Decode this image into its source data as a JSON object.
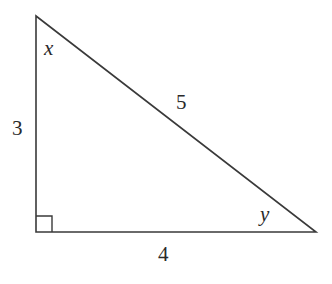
{
  "diagram": {
    "type": "right-triangle",
    "stroke_color": "#3a3a3a",
    "vertices": {
      "top": [
        36,
        16
      ],
      "right_angle": [
        36,
        232
      ],
      "right": [
        316,
        232
      ]
    },
    "right_angle_marker_size": 16,
    "sides": {
      "vertical": {
        "label": "3"
      },
      "hypotenuse": {
        "label": "5"
      },
      "horizontal": {
        "label": "4"
      }
    },
    "angles": {
      "top": {
        "label": "x"
      },
      "right": {
        "label": "y"
      }
    }
  }
}
